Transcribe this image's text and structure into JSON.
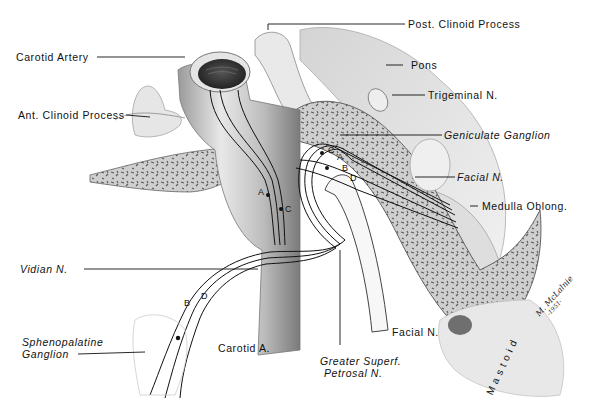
{
  "figure": {
    "labels": {
      "carotid_artery": "Carotid Artery",
      "post_clinoid": "Post. Clinoid Process",
      "pons": "Pons",
      "ant_clinoid": "Ant. Clinoid Process",
      "trigeminal": "Trigeminal N.",
      "geniculate": "Geniculate Ganglion",
      "facial_n_upper": "Facial N.",
      "medulla": "Medulla Oblong.",
      "vidian": "Vidian N.",
      "sphenopalatine_1": "Sphenopalatine",
      "sphenopalatine_2": "Ganglion",
      "carotid_a": "Carotid A.",
      "greater_superf_1": "Greater Superf.",
      "greater_superf_2": "Petrosal N.",
      "facial_n_lower": "Facial N.",
      "mastoid": "Mastoid"
    },
    "fiber_letters": {
      "a1": "A",
      "c1": "C",
      "c2": "C",
      "a2": "A",
      "b2": "B",
      "d2": "D",
      "b3": "B",
      "d3": "D"
    },
    "signature": {
      "name": "M. McLalnie",
      "year": "-1951-"
    },
    "colors": {
      "background": "#ffffff",
      "ink": "#111111",
      "bone": "#8a8a8a",
      "shade": "#c8c8c8"
    }
  }
}
